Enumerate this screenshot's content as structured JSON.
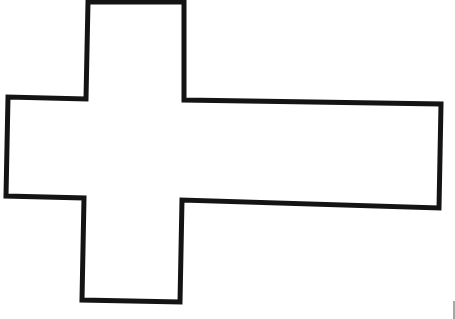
{
  "figure": {
    "background": "#ffffff",
    "stroke_color": "#141414",
    "stroke_width": 5,
    "outline_points": "88,2 184,2 184,100 441,104 439,208 182,200 180,302 82,300 84,198 6,196 8,97 86,99",
    "edge_mark_color": "#8a8a8a"
  }
}
